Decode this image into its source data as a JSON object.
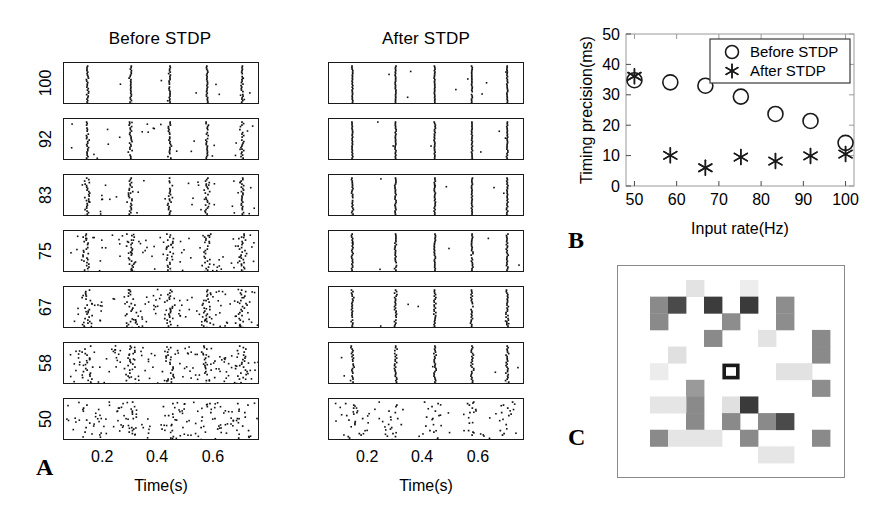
{
  "figure": {
    "panels": [
      {
        "letter": "A",
        "x": 36,
        "y": 455
      },
      {
        "letter": "B",
        "x": 568,
        "y": 228
      },
      {
        "letter": "C",
        "x": 568,
        "y": 425
      }
    ]
  },
  "panelA": {
    "columns": [
      {
        "id": "before",
        "title": "Before STDP",
        "title_x": 160,
        "title_y": 30,
        "left": 63,
        "width": 196
      },
      {
        "id": "after",
        "title": "After STDP",
        "title_x": 426,
        "title_y": 30,
        "left": 328,
        "width": 196
      }
    ],
    "row_labels": [
      "100",
      "92",
      "83",
      "75",
      "67",
      "58",
      "50"
    ],
    "row_tops": [
      62,
      118,
      174,
      230,
      286,
      342,
      398
    ],
    "row_height": 42,
    "xaxis": {
      "title": "Time(s)",
      "ticks": [
        "0.2",
        "0.4",
        "0.6"
      ],
      "tick_fracs": [
        0.2,
        0.48,
        0.765
      ],
      "label_y": 449,
      "title_y": 478
    },
    "ylabel_caption": "Input rate (Hz)"
  },
  "panelB": {
    "axes": {
      "x": {
        "label": "Input rate(Hz)",
        "min": 48,
        "max": 102,
        "ticks": [
          50,
          60,
          70,
          80,
          90,
          100
        ]
      },
      "y": {
        "label": "Timing precision(ms)",
        "min": 0,
        "max": 50,
        "ticks": [
          0,
          10,
          20,
          30,
          40,
          50
        ]
      }
    },
    "legend": {
      "entries": [
        {
          "marker": "circle",
          "label": "Before STDP"
        },
        {
          "marker": "asterisk",
          "label": "After STDP"
        }
      ]
    }
  },
  "chart_data": {
    "type": "scatter",
    "title": "",
    "xlabel": "Input rate(Hz)",
    "ylabel": "Timing precision(ms)",
    "xlim": [
      48,
      102
    ],
    "ylim": [
      0,
      50
    ],
    "xticks": [
      50,
      60,
      70,
      80,
      90,
      100
    ],
    "yticks": [
      0,
      10,
      20,
      30,
      40,
      50
    ],
    "grid": false,
    "legend_position": "top-right",
    "series": [
      {
        "name": "Before STDP",
        "marker": "circle",
        "x": [
          50,
          58.5,
          66.8,
          75.2,
          83.4,
          91.7,
          100
        ],
        "y": [
          34.8,
          34.1,
          33.0,
          29.4,
          23.7,
          21.4,
          14.2
        ]
      },
      {
        "name": "After STDP",
        "marker": "asterisk",
        "x": [
          50,
          58.5,
          66.8,
          75.2,
          83.4,
          91.7,
          100
        ],
        "y": [
          36.1,
          10.1,
          6.0,
          9.5,
          8.2,
          9.9,
          10.5
        ]
      }
    ]
  },
  "panelC": {
    "description": "Synaptic weight map grid",
    "grid": {
      "cols": 11,
      "rows": 11
    },
    "highlight_cell": {
      "col": 5,
      "row": 5,
      "outline": "#1a1a1a"
    },
    "cells": [
      {
        "col": 1,
        "row": 1,
        "gray": "#8a8a8a"
      },
      {
        "col": 1,
        "row": 2,
        "gray": "#8a8a8a"
      },
      {
        "col": 3,
        "row": 0,
        "gray": "#e3e3e3"
      },
      {
        "col": 2,
        "row": 1,
        "gray": "#4a4a4a"
      },
      {
        "col": 4,
        "row": 1,
        "gray": "#3c3c3c"
      },
      {
        "col": 6,
        "row": 0,
        "gray": "#ededed"
      },
      {
        "col": 6,
        "row": 1,
        "gray": "#3a3a3a"
      },
      {
        "col": 5,
        "row": 2,
        "gray": "#8d8d8d"
      },
      {
        "col": 4,
        "row": 3,
        "gray": "#8a8a8a"
      },
      {
        "col": 8,
        "row": 1,
        "gray": "#8d8d8d"
      },
      {
        "col": 8,
        "row": 2,
        "gray": "#8d8d8d"
      },
      {
        "col": 7,
        "row": 3,
        "gray": "#e3e3e3"
      },
      {
        "col": 10,
        "row": 3,
        "gray": "#8a8a8a"
      },
      {
        "col": 10,
        "row": 4,
        "gray": "#8a8a8a"
      },
      {
        "col": 2,
        "row": 4,
        "gray": "#e0e0e0"
      },
      {
        "col": 1,
        "row": 5,
        "gray": "#ececec"
      },
      {
        "col": 8,
        "row": 5,
        "gray": "#e2e2e2"
      },
      {
        "col": 9,
        "row": 5,
        "gray": "#e2e2e2"
      },
      {
        "col": 10,
        "row": 6,
        "gray": "#8d8d8d"
      },
      {
        "col": 3,
        "row": 6,
        "gray": "#9a9a9a"
      },
      {
        "col": 3,
        "row": 7,
        "gray": "#8a8a8a"
      },
      {
        "col": 1,
        "row": 7,
        "gray": "#e5e5e5"
      },
      {
        "col": 2,
        "row": 7,
        "gray": "#e5e5e5"
      },
      {
        "col": 3,
        "row": 8,
        "gray": "#8a8a8a"
      },
      {
        "col": 5,
        "row": 7,
        "gray": "#e0e0e0"
      },
      {
        "col": 6,
        "row": 7,
        "gray": "#3a3a3a"
      },
      {
        "col": 5,
        "row": 8,
        "gray": "#8a8a8a"
      },
      {
        "col": 7,
        "row": 8,
        "gray": "#8a8a8a"
      },
      {
        "col": 8,
        "row": 8,
        "gray": "#4a4a4a"
      },
      {
        "col": 6,
        "row": 9,
        "gray": "#8a8a8a"
      },
      {
        "col": 1,
        "row": 9,
        "gray": "#8a8a8a"
      },
      {
        "col": 2,
        "row": 9,
        "gray": "#e5e5e5"
      },
      {
        "col": 3,
        "row": 9,
        "gray": "#e5e5e5"
      },
      {
        "col": 4,
        "row": 9,
        "gray": "#e5e5e5"
      },
      {
        "col": 7,
        "row": 10,
        "gray": "#e6e6e6"
      },
      {
        "col": 8,
        "row": 10,
        "gray": "#e6e6e6"
      },
      {
        "col": 10,
        "row": 9,
        "gray": "#8a8a8a"
      }
    ]
  }
}
